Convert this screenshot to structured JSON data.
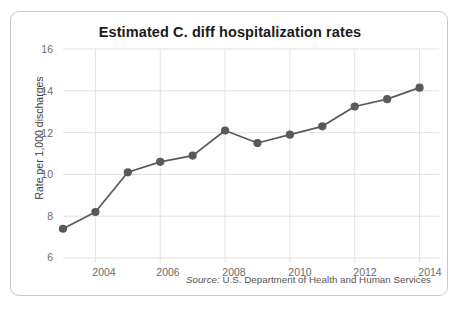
{
  "chart_data": {
    "type": "line",
    "title": "Estimated C. diff hospitalization rates",
    "xlabel": "",
    "ylabel": "Rate per 1,000 discharges",
    "x": [
      2003,
      2004,
      2005,
      2006,
      2007,
      2008,
      2009,
      2010,
      2011,
      2012,
      2013,
      2014
    ],
    "values": [
      7.4,
      8.2,
      10.1,
      10.6,
      10.9,
      12.1,
      11.5,
      11.9,
      12.3,
      13.25,
      13.6,
      14.15
    ],
    "series": [
      {
        "name": "Estimated C. diff hospitalization rate",
        "values": [
          7.4,
          8.2,
          10.1,
          10.6,
          10.9,
          12.1,
          11.5,
          11.9,
          12.3,
          13.25,
          13.6,
          14.15
        ]
      }
    ],
    "xlim": [
      2003,
      2014.6
    ],
    "ylim": [
      6,
      16
    ],
    "y_ticks": [
      6,
      8,
      10,
      12,
      14,
      16
    ],
    "x_ticks": [
      2004,
      2006,
      2008,
      2010,
      2012,
      2014
    ],
    "y_tick_labels": [
      "6",
      "8",
      "10",
      "12",
      "14",
      "16"
    ],
    "x_tick_labels": [
      "2004",
      "2006",
      "2008",
      "2010",
      "2012",
      "2014"
    ],
    "grid": true,
    "legend": "none",
    "line_color": "#595959",
    "marker_color": "#595959",
    "grid_color": "#e3e3e3"
  },
  "source": {
    "label": "Source:",
    "text": "U.S. Department of Health and Human Services"
  }
}
